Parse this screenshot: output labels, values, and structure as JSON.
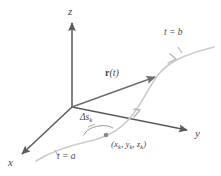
{
  "figure": {
    "background_color": "#ffffff",
    "axis_color": "#5a5a5a",
    "curve_color": "#c9c9c9",
    "vector_color": "#6a6a6a",
    "label_color": "#4a4a4a",
    "point_color": "#8a8a8a"
  },
  "axes": {
    "z_label": "z",
    "y_label": "y",
    "x_label": "x"
  },
  "curve": {
    "start_label": "t = a",
    "end_label": "t = b",
    "direction_arrows": 2
  },
  "vector": {
    "label_r": "r",
    "label_arg": "(t)"
  },
  "arc": {
    "delta_label": "Δs",
    "delta_sub": "k"
  },
  "point": {
    "label_open": "(",
    "x": "x",
    "x_sub": "k",
    "sep1": ", ",
    "y": "y",
    "y_sub": "k",
    "sep2": ", ",
    "z": "z",
    "z_sub": "k",
    "label_close": ")"
  }
}
